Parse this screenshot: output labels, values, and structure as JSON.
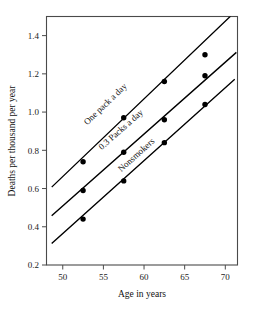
{
  "chart_data": {
    "type": "scatter",
    "title": "",
    "subtitle": "",
    "xlabel": "Age in years",
    "ylabel": "Deaths per thousand per year",
    "xlim": [
      48.0,
      71.5
    ],
    "ylim": [
      0.2,
      1.5
    ],
    "xticks": [
      50,
      55,
      60,
      65,
      70
    ],
    "xticklabels": [
      "50",
      "55",
      "60",
      "65",
      "70"
    ],
    "yticks": [
      0.2,
      0.4,
      0.6,
      0.8,
      1.0,
      1.2,
      1.4
    ],
    "yticklabels": [
      "0.2",
      "0.4",
      "0.6",
      "0.8",
      "1.0",
      "1.2",
      "1.4"
    ],
    "grid": false,
    "legend": "inline-annotations",
    "x": [
      52.5,
      57.5,
      62.5,
      67.5
    ],
    "series": [
      {
        "name": "One pack a day",
        "values": [
          0.74,
          0.97,
          1.16,
          1.3
        ],
        "fit_from": [
          48.7,
          0.61
        ],
        "fit_to": [
          70.6,
          1.5
        ],
        "label_x": 53.0,
        "label_y": 0.93
      },
      {
        "name": "0.3 Packs a day",
        "values": [
          0.59,
          0.79,
          0.96,
          1.19
        ],
        "fit_from": [
          48.7,
          0.46
        ],
        "fit_to": [
          71.3,
          1.31
        ],
        "label_x": 54.8,
        "label_y": 0.8
      },
      {
        "name": "Nonsmokers",
        "values": [
          0.44,
          0.64,
          0.84,
          1.04
        ],
        "fit_from": [
          48.7,
          0.315
        ],
        "fit_to": [
          71.1,
          1.17
        ],
        "label_x": 57.2,
        "label_y": 0.685
      }
    ]
  }
}
